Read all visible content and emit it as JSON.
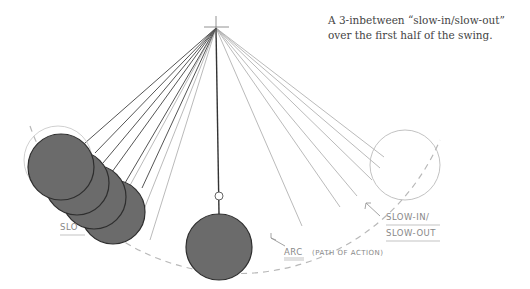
{
  "caption": {
    "line1": "A 3-inbetween “slow-in/slow-out”",
    "line2": "over the first half of the swing."
  },
  "labels": {
    "arc": "ARC",
    "arc_note": "(PATH OF ACTION)",
    "slow_in": "SLOW-IN/",
    "slow_out": "SLOW-OUT",
    "slow_left": "SLO"
  },
  "colors": {
    "bob_fill": "#6b6b6b",
    "bob_stroke": "#333333",
    "light_line": "#aaaaaa",
    "dark_line": "#444444",
    "arc_dash": "#b5b5b5",
    "ghost_circle": "#bbbbbb"
  }
}
